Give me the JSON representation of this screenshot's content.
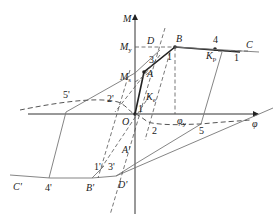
{
  "diagram": {
    "type": "moment-curvature hysteresis model",
    "axes": {
      "vertical": "M",
      "horizontal": "φ",
      "origin": "O"
    },
    "moment_levels": {
      "yield": {
        "symbol": "M",
        "subscript": "y"
      },
      "crack": {
        "symbol": "M",
        "subscript": "s"
      }
    },
    "curvature_levels": {
      "yield": {
        "symbol": "φ",
        "subscript": "y"
      }
    },
    "stiffness_labels": {
      "elastic": {
        "symbol": "K",
        "subscript": "e"
      },
      "plastic": {
        "symbol": "K",
        "subscript": "p"
      }
    },
    "points_positive": [
      "O",
      "A",
      "B",
      "C",
      "D"
    ],
    "points_negative": [
      "A'",
      "B'",
      "C'",
      "D'"
    ],
    "path_numbers_positive": [
      "1",
      "2",
      "3",
      "4",
      "5"
    ],
    "path_numbers_negative": [
      "1'",
      "2'",
      "3'",
      "4'",
      "5'"
    ],
    "slope_unit_labels": [
      "1",
      "1",
      "1"
    ]
  }
}
